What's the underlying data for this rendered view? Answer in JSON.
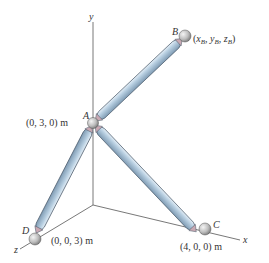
{
  "diagram": {
    "type": "3D strut/rod assembly",
    "axes": {
      "x_label": "x",
      "y_label": "y",
      "z_label": "z"
    },
    "points": {
      "A": {
        "name": "A",
        "coords": "(0, 3, 0) m"
      },
      "B": {
        "name": "B",
        "coords_prefix": "(",
        "coords_sub1": "x",
        "s1": "B",
        "coords_sub2": "y",
        "s2": "B",
        "coords_sub3": "z",
        "s3": "B",
        "coords_suffix": ")"
      },
      "C": {
        "name": "C",
        "coords": "(4, 0, 0) m"
      },
      "D": {
        "name": "D",
        "coords": "(0, 0, 3) m"
      }
    },
    "members": [
      "AB",
      "AC",
      "AD"
    ],
    "colors": {
      "rod_fill": "#a9c3d8",
      "rod_highlight": "#dbe8f2",
      "rod_outline": "#4a5a6a",
      "end_cap": "#c9a9b3",
      "joint_ball": "#c8c8c8",
      "axis_line": "#555555"
    }
  }
}
